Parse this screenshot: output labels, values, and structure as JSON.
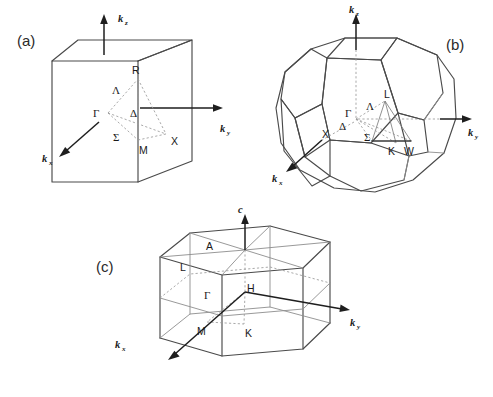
{
  "figure": {
    "background_color": "#ffffff",
    "line_color": "#4a4a4a",
    "dashed_color": "#9a9a9a",
    "axis_color": "#1e1e1e"
  },
  "panels": [
    {
      "id": "a",
      "tag": "(a)",
      "name": "simple-cubic-brillouin-zone",
      "axes": [
        {
          "name": "kz",
          "base": "k",
          "sub": "z"
        },
        {
          "name": "ky",
          "base": "k",
          "sub": "y"
        },
        {
          "name": "kx",
          "base": "k",
          "sub": "x"
        }
      ],
      "points": [
        {
          "label": "R",
          "x": 138,
          "y": 71
        },
        {
          "label": "Γ",
          "x": 99,
          "y": 114
        },
        {
          "label": "X",
          "x": 176,
          "y": 139
        },
        {
          "label": "M",
          "x": 142,
          "y": 148
        },
        {
          "label": "Λ",
          "x": 116,
          "y": 90
        },
        {
          "label": "Δ",
          "x": 133,
          "y": 113
        },
        {
          "label": "Σ",
          "x": 117,
          "y": 137
        }
      ]
    },
    {
      "id": "b",
      "tag": "(b)",
      "name": "fcc-brillouin-zone-truncated-octahedron",
      "axes": [
        {
          "name": "kz",
          "base": "k",
          "sub": "z"
        },
        {
          "name": "ky",
          "base": "k",
          "sub": "y"
        },
        {
          "name": "kx",
          "base": "k",
          "sub": "x"
        }
      ],
      "points": [
        {
          "label": "L",
          "x": 388,
          "y": 106
        },
        {
          "label": "Γ",
          "x": 355,
          "y": 120
        },
        {
          "label": "Λ",
          "x": 371,
          "y": 112
        },
        {
          "label": "Σ",
          "x": 370,
          "y": 139
        },
        {
          "label": "K",
          "x": 392,
          "y": 150
        },
        {
          "label": "W",
          "x": 409,
          "y": 149
        },
        {
          "label": "X",
          "x": 327,
          "y": 134
        },
        {
          "label": "Δ",
          "x": 344,
          "y": 127
        }
      ]
    },
    {
      "id": "c",
      "tag": "(c)",
      "name": "hexagonal-brillouin-zone-prism",
      "axes": [
        {
          "name": "c",
          "base": "c",
          "sub": ""
        },
        {
          "name": "ky",
          "base": "k",
          "sub": "y"
        },
        {
          "name": "kx",
          "base": "k",
          "sub": "x"
        }
      ],
      "points": [
        {
          "label": "A",
          "x": 212,
          "y": 246
        },
        {
          "label": "L",
          "x": 184,
          "y": 267
        },
        {
          "label": "H",
          "x": 251,
          "y": 288
        },
        {
          "label": "Γ",
          "x": 210,
          "y": 296
        },
        {
          "label": "M",
          "x": 202,
          "y": 329
        },
        {
          "label": "K",
          "x": 249,
          "y": 331
        }
      ]
    }
  ],
  "labels": {
    "panel_a": "(a)",
    "panel_b": "(b)",
    "panel_c": "(c)",
    "R": "R",
    "X": "X",
    "M": "M",
    "L": "L",
    "K": "K",
    "W": "W",
    "A": "A",
    "H": "H",
    "Gamma": "Γ",
    "Lambda": "Λ",
    "Delta": "Δ",
    "Sigma": "Σ",
    "k": "k",
    "c": "c",
    "sub_x": "x",
    "sub_y": "y",
    "sub_z": "z"
  }
}
